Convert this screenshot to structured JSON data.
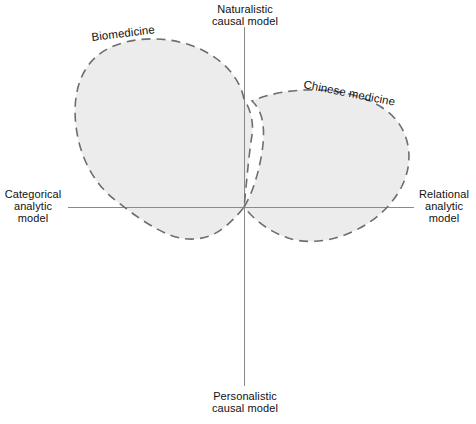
{
  "figure": {
    "title_present": false,
    "background_color": "#ffffff",
    "axes": {
      "vertical": {
        "top_label": {
          "line1": "Naturalistic",
          "line2": "causal model"
        },
        "bottom_label": {
          "line1": "Personalistic",
          "line2": "causal model"
        },
        "color": "#8a8a8a"
      },
      "horizontal": {
        "left_label": {
          "line1": "Categorical",
          "line2": "analytic",
          "line3": "model"
        },
        "right_label": {
          "line1": "Relational",
          "line2": "analytic",
          "line3": "model"
        },
        "color": "#8a8a8a"
      }
    },
    "regions": [
      {
        "id": "biomedicine",
        "label": "Biomedicine",
        "fill_color": "#ececec",
        "outline_color": "#6e6e6e",
        "outline_style": "dashed",
        "quadrants": "upper-left spanning across vertical axis and below horizontal axis"
      },
      {
        "id": "chinese-medicine",
        "label": "Chinese medicine",
        "fill_color": "#ececec",
        "outline_color": "#6e6e6e",
        "outline_style": "dashed",
        "quadrants": "upper-right spanning across vertical axis and below horizontal axis"
      }
    ],
    "overlap": {
      "id": "overlap-region",
      "label": "",
      "fill_color": "#cacaca"
    }
  }
}
